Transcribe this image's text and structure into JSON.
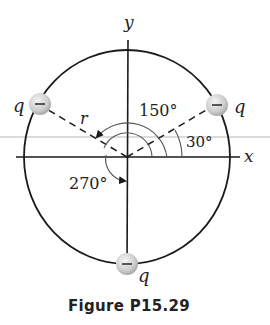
{
  "figure": {
    "caption": "Figure P15.29",
    "axes": {
      "x_label": "x",
      "y_label": "y"
    },
    "radius_label": "r",
    "angles": [
      {
        "label": "150°",
        "degrees": 150
      },
      {
        "label": "30°",
        "degrees": 30
      },
      {
        "label": "270°",
        "degrees": 270
      }
    ],
    "charges": [
      {
        "label": "q",
        "sign": "–",
        "angle": 150
      },
      {
        "label": "q",
        "sign": "–",
        "angle": 30
      },
      {
        "label": "q",
        "sign": "–",
        "angle": 270
      }
    ],
    "colors": {
      "line": "#1a1a1a",
      "guide_line": "#b8b8b8",
      "charge_fill": "#cfcfcf",
      "charge_highlight": "#f2f2f2"
    }
  }
}
